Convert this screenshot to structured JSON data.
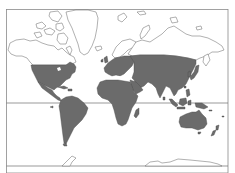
{
  "map": {
    "type": "world distribution map",
    "projection": "Mercator-like",
    "colors": {
      "background": "#ffffff",
      "shaded_land": "#6b6b6b",
      "unshaded_outline": "#707070",
      "frame": "#8a8a8a"
    },
    "lines": [
      {
        "name": "equator",
        "y": 103
      },
      {
        "name": "southern-boundary",
        "y": 166
      }
    ],
    "shaded_regions": [
      "North America (USA, southern Canada, Mexico)",
      "Central America",
      "Caribbean",
      "South America",
      "Europe",
      "Africa",
      "Middle East",
      "Northern & Central Asia (south of Siberian Arctic)",
      "South Asia",
      "East Asia",
      "Japan",
      "Southeast Asia & Indonesia",
      "Australia",
      "New Zealand",
      "Madagascar"
    ],
    "unshaded_regions": [
      "Alaska",
      "Northern Canada & Arctic Archipelago",
      "Greenland",
      "Iceland",
      "Scandinavia (north)",
      "Arctic Siberia",
      "Antarctica"
    ]
  }
}
